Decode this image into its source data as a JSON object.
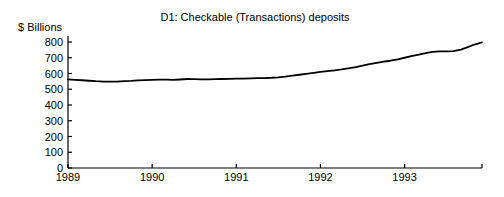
{
  "chart_data": {
    "type": "line",
    "title": "D1: Checkable (Transactions) deposits",
    "ylabel": "$ Billions",
    "xlabel": "",
    "grid": false,
    "legend": false,
    "ylim": [
      0,
      850
    ],
    "xlim": [
      1989.0,
      1993.92
    ],
    "yticks": [
      0,
      100,
      200,
      300,
      400,
      500,
      600,
      700,
      800
    ],
    "ytick_labels": [
      "0",
      "100",
      "200",
      "300",
      "400",
      "500",
      "600",
      "700",
      "800"
    ],
    "xticks": [
      1989,
      1990,
      1991,
      1992,
      1993,
      1993.92
    ],
    "xtick_labels": [
      "1989",
      "1990",
      "1991",
      "1992",
      "1993",
      ""
    ],
    "series": [
      {
        "name": "D1: Checkable (Transactions) deposits",
        "color": "#000000",
        "x": [
          1989.0,
          1989.08,
          1989.17,
          1989.25,
          1989.33,
          1989.42,
          1989.5,
          1989.58,
          1989.67,
          1989.75,
          1989.83,
          1989.92,
          1990.0,
          1990.08,
          1990.17,
          1990.25,
          1990.33,
          1990.42,
          1990.5,
          1990.58,
          1990.67,
          1990.75,
          1990.83,
          1990.92,
          1991.0,
          1991.08,
          1991.17,
          1991.25,
          1991.33,
          1991.42,
          1991.5,
          1991.58,
          1991.67,
          1991.75,
          1991.83,
          1991.92,
          1992.0,
          1992.08,
          1992.17,
          1992.25,
          1992.33,
          1992.42,
          1992.5,
          1992.58,
          1992.67,
          1992.75,
          1992.83,
          1992.92,
          1993.0,
          1993.08,
          1993.17,
          1993.25,
          1993.33,
          1993.42,
          1993.5,
          1993.58,
          1993.67,
          1993.75,
          1993.83,
          1993.92
        ],
        "y": [
          563,
          560,
          557,
          554,
          551,
          549,
          548,
          549,
          551,
          553,
          556,
          558,
          560,
          561,
          561,
          560,
          562,
          565,
          564,
          563,
          563,
          564,
          565,
          566,
          567,
          568,
          569,
          570,
          571,
          573,
          576,
          580,
          586,
          592,
          598,
          604,
          610,
          615,
          620,
          626,
          633,
          641,
          650,
          660,
          668,
          675,
          681,
          690,
          700,
          710,
          720,
          730,
          737,
          740,
          741,
          742,
          752,
          768,
          784,
          798
        ]
      }
    ],
    "annotations": []
  },
  "colors": {
    "background": "#ffffff",
    "axis": "#000000",
    "line": "#000000",
    "text": "#000000"
  }
}
